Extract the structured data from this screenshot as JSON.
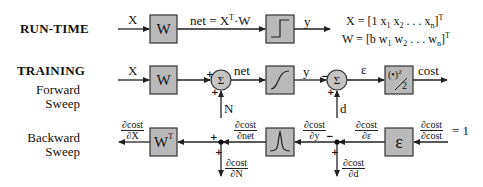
{
  "sections": {
    "runtime": "RUN-TIME",
    "training": "TRAINING",
    "forward_line1": "Forward",
    "forward_line2": "Sweep",
    "backward_line1": "Backward",
    "backward_line2": "Sweep"
  },
  "runtime": {
    "input_label": "X",
    "weight_block": "W",
    "net_eq_lhs": "net = X",
    "net_eq_sup": "T",
    "net_eq_rhs": "·W",
    "activation": "step",
    "output_label": "y",
    "eq_x_lhs": "X  =  [1 x",
    "eq_x_rest": " x",
    "eq_x_dots": " . . .  x",
    "eq_x_close": "]",
    "eq_x_sub1": "1",
    "eq_x_sub2": "2",
    "eq_x_subn": "n",
    "eq_w_lhs": "W  =  [b  w",
    "eq_w_rest": " w",
    "eq_w_dots": " . . .  w",
    "eq_w_close": "]",
    "eq_w_sub1": "1",
    "eq_w_sub2": "2",
    "eq_w_subn": "n",
    "transpose": "T"
  },
  "forward": {
    "input_label": "X",
    "weight_block": "W",
    "sum1_symbol": "Σ",
    "sum1_noise": "N",
    "net_label": "net",
    "activation": "sigmoid",
    "output_label": "y",
    "sum2_symbol": "Σ",
    "desired_label": "d",
    "error_label": "ε",
    "cost_block_num": "(•)",
    "cost_block_exp": "2",
    "cost_block_den": "2",
    "cost_label": "cost",
    "sign_plus": "+",
    "sign_minus": "−"
  },
  "backward": {
    "weight_block": "W",
    "weight_sup": "T",
    "derivative_block": "Λ",
    "error_block": "ε",
    "d_cost_dX": {
      "num": "∂cost",
      "den": "∂X"
    },
    "d_cost_dnet": {
      "num": "∂cost",
      "den": "∂net"
    },
    "d_cost_dN": {
      "num": "∂cost",
      "den": "∂N"
    },
    "d_cost_dy": {
      "num": "∂cost",
      "den": "∂y"
    },
    "d_cost_dd": {
      "num": "∂cost",
      "den": "∂d"
    },
    "d_cost_de": {
      "num": "∂cost",
      "den": "∂ε"
    },
    "d_cost_dcost": {
      "num": "∂cost",
      "den": "∂cost"
    },
    "seed_value": "= 1",
    "sign_plus": "+",
    "sign_minus": "−"
  },
  "colors": {
    "block_fill": "#b9b9b9",
    "line": "#222222"
  }
}
